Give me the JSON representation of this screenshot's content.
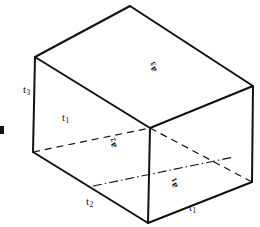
{
  "figure": {
    "stroke_color": "#111111",
    "background_color": "#ffffff",
    "edge_labels": [
      {
        "name": "t3-left-vertical",
        "text": "t",
        "sub": "3",
        "x": 23,
        "y": 84
      },
      {
        "name": "t1-hidden-depth",
        "text": "t",
        "sub": "1",
        "x": 62,
        "y": 112
      },
      {
        "name": "t2-bottom-left",
        "text": "t",
        "sub": "2",
        "x": 86,
        "y": 196
      },
      {
        "name": "t1-bottom-right",
        "text": "t",
        "sub": "1",
        "x": 189,
        "y": 202
      }
    ],
    "face_labels": [
      {
        "name": "a3-top-face",
        "text": "a",
        "sub": "3",
        "x": 150,
        "y": 74
      },
      {
        "name": "a2-left-face",
        "text": "a",
        "sub": "2",
        "x": 110,
        "y": 150
      },
      {
        "name": "a1-right-face",
        "text": "a",
        "sub": "1",
        "x": 171,
        "y": 190
      }
    ],
    "edge_margin_tick": {
      "name": "left-margin-tick",
      "x": 0,
      "y": 130
    },
    "geometry": {
      "vertices": {
        "top_back": [
          130,
          6
        ],
        "top_left": [
          35,
          57
        ],
        "top_right": [
          253,
          86
        ],
        "top_front": [
          150,
          128
        ],
        "bottom_left": [
          33,
          152
        ],
        "bottom_right": [
          252,
          182
        ],
        "bottom_front": [
          148,
          223
        ]
      },
      "solid_edges": [
        [
          [
            130,
            6
          ],
          [
            35,
            57
          ]
        ],
        [
          [
            130,
            6
          ],
          [
            253,
            86
          ]
        ],
        [
          [
            35,
            57
          ],
          [
            33,
            152
          ]
        ],
        [
          [
            253,
            86
          ],
          [
            252,
            182
          ]
        ],
        [
          [
            33,
            152
          ],
          [
            148,
            223
          ]
        ],
        [
          [
            148,
            223
          ],
          [
            252,
            182
          ]
        ],
        [
          [
            150,
            128
          ],
          [
            148,
            223
          ]
        ],
        [
          [
            35,
            57
          ],
          [
            150,
            128
          ]
        ],
        [
          [
            253,
            86
          ],
          [
            150,
            128
          ]
        ]
      ],
      "dashed_edges": [
        [
          [
            33,
            152
          ],
          [
            150,
            128
          ]
        ],
        [
          [
            150,
            128
          ],
          [
            252,
            182
          ]
        ]
      ],
      "dashdot_edges": [
        [
          [
            93,
            186
          ],
          [
            232,
            158
          ]
        ]
      ]
    }
  }
}
